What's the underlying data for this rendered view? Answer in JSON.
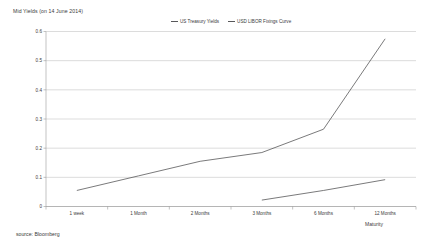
{
  "chart_data": {
    "type": "line",
    "title": "Mid Yields (on 14 June 2014)",
    "xlabel": "Maturity",
    "ylabel": "",
    "source": "source: Bloomberg",
    "categories": [
      "1 week",
      "1 Month",
      "2 Months",
      "3 Months",
      "6 Months",
      "12 Months"
    ],
    "ylim": [
      0,
      0.6
    ],
    "ytick_labels": [
      "0",
      "0.1",
      "0.2",
      "0.3",
      "0.4",
      "0.5",
      "0.6"
    ],
    "ytick_values": [
      0,
      0.1,
      0.2,
      0.3,
      0.4,
      0.5,
      0.6
    ],
    "grid": true,
    "legend_position": "top-center",
    "series": [
      {
        "name": "US Treasury Yields",
        "color": "#4d4d4f",
        "values": [
          0.055,
          0.105,
          0.155,
          0.185,
          0.265,
          0.575
        ]
      },
      {
        "name": "USD LIBOR Fixings Curve",
        "color": "#4d4d4f",
        "values": [
          null,
          null,
          null,
          0.022,
          0.055,
          0.092
        ]
      }
    ]
  },
  "legend": {
    "items": [
      {
        "label": "US Treasury Yields"
      },
      {
        "label": "USD LIBOR Fixings Curve"
      }
    ]
  }
}
